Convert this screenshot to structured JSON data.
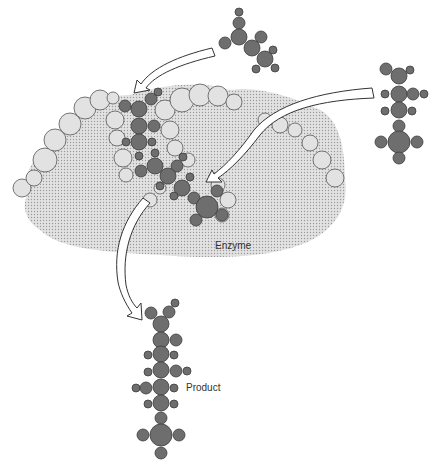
{
  "diagram": {
    "labels": {
      "enzyme": "Enzyme",
      "product": "Product"
    },
    "colors": {
      "atom_fill": "#6e6e6e",
      "enzyme_fill": "#d6d6d6",
      "background": "#ffffff"
    },
    "elements": [
      "substrate-molecule-1",
      "substrate-molecule-2",
      "enzyme",
      "bound-complex",
      "product-molecule"
    ]
  }
}
